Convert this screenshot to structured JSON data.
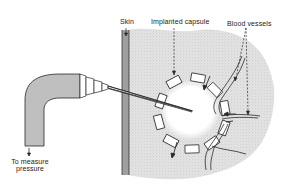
{
  "figure": {
    "type": "schematic diagram"
  },
  "labels": {
    "skin": "Skin",
    "capsule": "Implanted capsule",
    "vessels": "Blood vessels",
    "measure_line1": "To measure",
    "measure_line2": "pressure"
  },
  "colors": {
    "ink": "#2a2a2a",
    "tissue": "#dcdcdc",
    "skin_band": "#9a9a9a",
    "tube": "#b8b8b8",
    "background": "#ffffff"
  }
}
